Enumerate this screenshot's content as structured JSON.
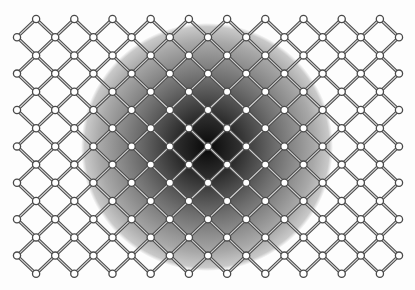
{
  "diagram": {
    "type": "diamond-lattice",
    "width": 415,
    "height": 290,
    "background": "#fdfdfd",
    "grid": {
      "columns": 21,
      "rows": 15,
      "origin_x": 17,
      "origin_y": 19,
      "step_x": 19.1,
      "step_y": 18.2,
      "node_rule": "i+j odd",
      "connections": "diagonal neighbors"
    },
    "node_style": {
      "radius": 3.6,
      "fill": "#ffffff",
      "stroke": "#4a4a4a",
      "stroke_width": 1.3
    },
    "edge_style": {
      "outer_color": "#4d4d4d",
      "outer_width": 3.2,
      "inner_color": "#d8d8d8",
      "inner_width": 1.1
    },
    "shading": {
      "type": "radial-gradient-blob",
      "center_x": 207,
      "center_y": 147,
      "radius_x": 126,
      "radius_y": 124,
      "stops": [
        {
          "offset": 0,
          "color": "#080808"
        },
        {
          "offset": 0.25,
          "color": "#2e2e2e"
        },
        {
          "offset": 0.55,
          "color": "#6e6e6e"
        },
        {
          "offset": 0.85,
          "color": "#a8a8a8"
        },
        {
          "offset": 0.97,
          "color": "#c9c9c9"
        },
        {
          "offset": 1,
          "color": "#fdfdfd"
        }
      ]
    }
  }
}
